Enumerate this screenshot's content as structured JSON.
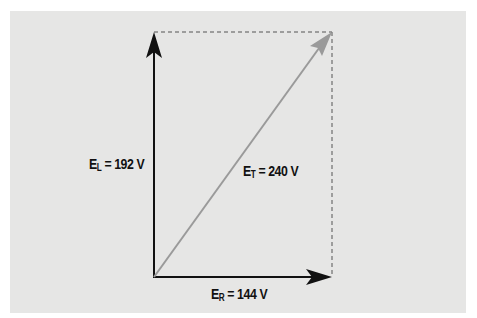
{
  "diagram": {
    "type": "phasor-diagram",
    "colors": {
      "background": "#e6e6e5",
      "border": "#ffffff",
      "axis_arrows": "#111111",
      "resultant_arrow": "#9a9a9a",
      "dashed_lines": "#555555"
    },
    "vectors": [
      {
        "name": "E_L",
        "symbol": "E",
        "subscript": "L",
        "value": "192 V",
        "label": "= 192 V",
        "direction": "up"
      },
      {
        "name": "E_R",
        "symbol": "E",
        "subscript": "R",
        "value": "144 V",
        "label": "= 144 V",
        "direction": "right"
      },
      {
        "name": "E_T",
        "symbol": "E",
        "subscript": "T",
        "value": "240 V",
        "label": "= 240 V",
        "direction": "diagonal"
      }
    ]
  }
}
